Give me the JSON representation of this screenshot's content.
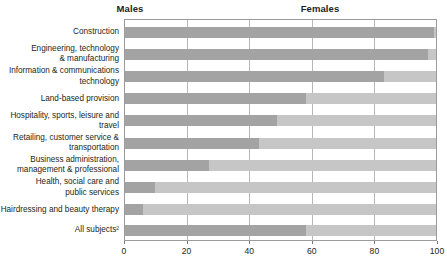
{
  "header": {
    "males_label": "Males",
    "females_label": "Females"
  },
  "axis": {
    "ticks": [
      "0",
      "20",
      "40",
      "60",
      "80",
      "100"
    ],
    "tick_values": [
      0,
      20,
      40,
      60,
      80,
      100
    ],
    "min": 0,
    "max": 100
  },
  "colors": {
    "male_bar": "#a3a3a3",
    "female_bar": "#c6c6c6",
    "gridline": "#b7b7b7",
    "border": "#9b9b9b",
    "text": "#231f20"
  },
  "categories": [
    {
      "label": "Construction",
      "males": 99,
      "females": 1
    },
    {
      "label": "Engineering, technology\n& manufacturing",
      "males": 97,
      "females": 3
    },
    {
      "label": "Information & communications\ntechnology",
      "males": 83,
      "females": 17
    },
    {
      "label": "Land-based provision",
      "males": 58,
      "females": 42
    },
    {
      "label": "Hospitality, sports, leisure and\ntravel",
      "males": 49,
      "females": 51
    },
    {
      "label": "Retailing, customer service &\ntransportation",
      "males": 43,
      "females": 57
    },
    {
      "label": "Business administration,\nmanagement & professional",
      "males": 27,
      "females": 73
    },
    {
      "label": "Health, social care and\npublic services",
      "males": 10,
      "females": 90
    },
    {
      "label": "Hairdressing and beauty therapy",
      "males": 6,
      "females": 94
    },
    {
      "label": "All subjects²",
      "males": 58,
      "females": 42
    }
  ],
  "chart_data": {
    "type": "bar",
    "orientation": "horizontal",
    "stacked": true,
    "stacked_percent": true,
    "title": "",
    "subtitle": "",
    "xlabel": "",
    "ylabel": "",
    "xlim": [
      0,
      100
    ],
    "xticks": [
      0,
      20,
      40,
      60,
      80,
      100
    ],
    "grid": true,
    "grid_axis": "x",
    "legend": "top",
    "legend_entries": [
      "Males",
      "Females"
    ],
    "categories": [
      "Construction",
      "Engineering, technology & manufacturing",
      "Information & communications technology",
      "Land-based provision",
      "Hospitality, sports, leisure and travel",
      "Retailing, customer service & transportation",
      "Business administration, management & professional",
      "Health, social care and public services",
      "Hairdressing and beauty therapy",
      "All subjects²"
    ],
    "series": [
      {
        "name": "Males",
        "color": "#a3a3a3",
        "values": [
          99,
          97,
          83,
          58,
          49,
          43,
          27,
          10,
          6,
          58
        ]
      },
      {
        "name": "Females",
        "color": "#c6c6c6",
        "values": [
          1,
          3,
          17,
          42,
          51,
          57,
          73,
          90,
          94,
          42
        ]
      }
    ],
    "annotations": [
      "All subjects² row is separated from the subject rows by a gap"
    ]
  }
}
